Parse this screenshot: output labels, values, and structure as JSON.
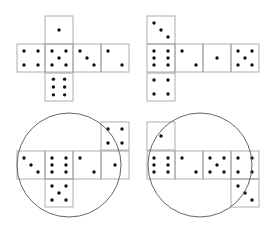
{
  "colors": {
    "background": "#ffffff",
    "face_border": "#9a9a9a",
    "fold_line": "#b8b8b8",
    "pip": "#111111",
    "circle": "#555555"
  },
  "face_size": 28,
  "pip_radius": 1.7,
  "nets": [
    {
      "name": "net-cross",
      "faces": [
        {
          "x": 45,
          "y": 16,
          "value": 1,
          "pips": [
            [
              0.5,
              0.5
            ]
          ]
        },
        {
          "x": 17,
          "y": 44,
          "value": 4,
          "pips": [
            [
              0.25,
              0.25
            ],
            [
              0.75,
              0.25
            ],
            [
              0.25,
              0.75
            ],
            [
              0.75,
              0.75
            ]
          ]
        },
        {
          "x": 45,
          "y": 44,
          "value": 5,
          "pips": [
            [
              0.25,
              0.25
            ],
            [
              0.75,
              0.25
            ],
            [
              0.5,
              0.5
            ],
            [
              0.25,
              0.75
            ],
            [
              0.75,
              0.75
            ]
          ]
        },
        {
          "x": 73,
          "y": 44,
          "value": 3,
          "pips": [
            [
              0.25,
              0.25
            ],
            [
              0.5,
              0.5
            ],
            [
              0.75,
              0.75
            ]
          ]
        },
        {
          "x": 101,
          "y": 44,
          "value": 2,
          "pips": [
            [
              0.25,
              0.25
            ],
            [
              0.75,
              0.75
            ]
          ]
        },
        {
          "x": 45,
          "y": 73,
          "value": 6,
          "pips": [
            [
              0.3,
              0.22
            ],
            [
              0.7,
              0.22
            ],
            [
              0.3,
              0.5
            ],
            [
              0.7,
              0.5
            ],
            [
              0.3,
              0.78
            ],
            [
              0.7,
              0.78
            ]
          ]
        }
      ],
      "fold_lines": [
        [
          45,
          44,
          45,
          73
        ],
        [
          73,
          44,
          73,
          73
        ],
        [
          45,
          44,
          73,
          44
        ],
        [
          45,
          73,
          73,
          73
        ],
        [
          101,
          44,
          101,
          73
        ]
      ],
      "circle": null
    },
    {
      "name": "net-t-shape",
      "faces": [
        {
          "x": 147,
          "y": 16,
          "value": 3,
          "pips": [
            [
              0.25,
              0.25
            ],
            [
              0.5,
              0.5
            ],
            [
              0.75,
              0.75
            ]
          ]
        },
        {
          "x": 147,
          "y": 44,
          "value": 6,
          "pips": [
            [
              0.25,
              0.25
            ],
            [
              0.75,
              0.25
            ],
            [
              0.25,
              0.5
            ],
            [
              0.75,
              0.5
            ],
            [
              0.25,
              0.75
            ],
            [
              0.75,
              0.75
            ]
          ]
        },
        {
          "x": 147,
          "y": 73,
          "value": 4,
          "pips": [
            [
              0.25,
              0.25
            ],
            [
              0.75,
              0.25
            ],
            [
              0.25,
              0.75
            ],
            [
              0.75,
              0.75
            ]
          ]
        },
        {
          "x": 175,
          "y": 44,
          "value": 2,
          "pips": [
            [
              0.25,
              0.25
            ],
            [
              0.75,
              0.75
            ]
          ]
        },
        {
          "x": 203,
          "y": 44,
          "value": 1,
          "pips": [
            [
              0.5,
              0.5
            ]
          ]
        },
        {
          "x": 231,
          "y": 44,
          "value": 5,
          "pips": [
            [
              0.25,
              0.25
            ],
            [
              0.75,
              0.25
            ],
            [
              0.5,
              0.5
            ],
            [
              0.25,
              0.75
            ],
            [
              0.75,
              0.75
            ]
          ]
        }
      ],
      "fold_lines": [
        [
          147,
          44,
          175,
          44
        ],
        [
          147,
          73,
          175,
          73
        ],
        [
          175,
          44,
          175,
          73
        ],
        [
          203,
          44,
          203,
          73
        ],
        [
          231,
          44,
          231,
          73
        ]
      ],
      "circle": null
    },
    {
      "name": "net-circled-left",
      "faces": [
        {
          "x": 101,
          "y": 122,
          "value": 4,
          "pips": [
            [
              0.25,
              0.25
            ],
            [
              0.75,
              0.25
            ],
            [
              0.25,
              0.75
            ],
            [
              0.75,
              0.75
            ]
          ]
        },
        {
          "x": 17,
          "y": 151,
          "value": 3,
          "pips": [
            [
              0.25,
              0.25
            ],
            [
              0.5,
              0.5
            ],
            [
              0.75,
              0.75
            ]
          ]
        },
        {
          "x": 45,
          "y": 151,
          "value": 6,
          "pips": [
            [
              0.25,
              0.25
            ],
            [
              0.75,
              0.25
            ],
            [
              0.25,
              0.5
            ],
            [
              0.75,
              0.5
            ],
            [
              0.25,
              0.75
            ],
            [
              0.75,
              0.75
            ]
          ]
        },
        {
          "x": 73,
          "y": 151,
          "value": 2,
          "pips": [
            [
              0.25,
              0.25
            ],
            [
              0.75,
              0.75
            ]
          ]
        },
        {
          "x": 101,
          "y": 151,
          "value": 1,
          "pips": [
            [
              0.5,
              0.5
            ]
          ]
        },
        {
          "x": 45,
          "y": 179,
          "value": 5,
          "pips": [
            [
              0.25,
              0.25
            ],
            [
              0.75,
              0.25
            ],
            [
              0.5,
              0.5
            ],
            [
              0.25,
              0.75
            ],
            [
              0.75,
              0.75
            ]
          ]
        }
      ],
      "fold_lines": [
        [
          101,
          151,
          129,
          151
        ],
        [
          45,
          151,
          45,
          179
        ],
        [
          73,
          151,
          73,
          179
        ],
        [
          101,
          151,
          101,
          179
        ],
        [
          45,
          179,
          73,
          179
        ]
      ],
      "circle": {
        "cx": 69,
        "cy": 165,
        "r": 52
      }
    },
    {
      "name": "net-circled-right",
      "faces": [
        {
          "x": 147,
          "y": 122,
          "value": 1,
          "pips": [
            [
              0.5,
              0.5
            ]
          ]
        },
        {
          "x": 147,
          "y": 151,
          "value": 6,
          "pips": [
            [
              0.25,
              0.25
            ],
            [
              0.75,
              0.25
            ],
            [
              0.25,
              0.5
            ],
            [
              0.75,
              0.5
            ],
            [
              0.25,
              0.75
            ],
            [
              0.75,
              0.75
            ]
          ]
        },
        {
          "x": 175,
          "y": 151,
          "value": 2,
          "pips": [
            [
              0.25,
              0.25
            ],
            [
              0.75,
              0.75
            ]
          ]
        },
        {
          "x": 203,
          "y": 151,
          "value": 5,
          "pips": [
            [
              0.25,
              0.25
            ],
            [
              0.75,
              0.25
            ],
            [
              0.5,
              0.5
            ],
            [
              0.25,
              0.75
            ],
            [
              0.75,
              0.75
            ]
          ]
        },
        {
          "x": 231,
          "y": 151,
          "value": 4,
          "pips": [
            [
              0.25,
              0.25
            ],
            [
              0.75,
              0.25
            ],
            [
              0.25,
              0.75
            ],
            [
              0.75,
              0.75
            ]
          ]
        },
        {
          "x": 231,
          "y": 179,
          "value": 3,
          "pips": [
            [
              0.25,
              0.25
            ],
            [
              0.5,
              0.5
            ],
            [
              0.75,
              0.75
            ]
          ]
        }
      ],
      "fold_lines": [
        [
          147,
          151,
          175,
          151
        ],
        [
          175,
          151,
          175,
          179
        ],
        [
          203,
          151,
          203,
          179
        ],
        [
          231,
          151,
          231,
          179
        ],
        [
          231,
          179,
          259,
          179
        ]
      ],
      "circle": {
        "cx": 200,
        "cy": 165,
        "r": 52
      }
    }
  ]
}
